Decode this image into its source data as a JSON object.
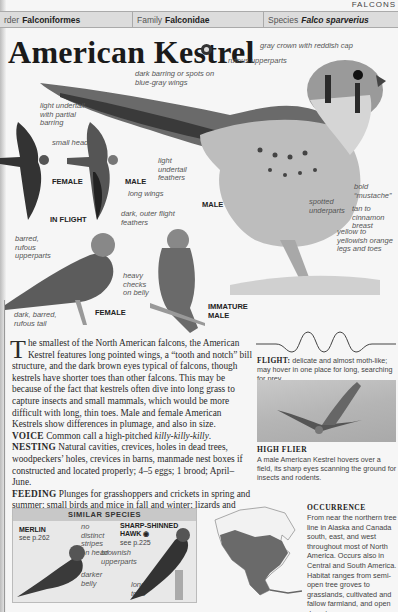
{
  "section_tag": "FALCONS",
  "taxonomy": {
    "order_label": "Order",
    "order_label_visible": "rder",
    "order_value": "Falconiformes",
    "family_label": "Family",
    "family_value": "Falconidae",
    "species_label": "Species",
    "species_value": "Falco sparverius"
  },
  "title": "American Kestrel",
  "audio_icon": "audio-disc-icon",
  "main_illustration": {
    "caption": "MALE",
    "labels": [
      "gray crown with reddish cap",
      "rufous upperparts",
      "dark barring or spots on blue-gray wings",
      "light undertail with partial barring",
      "light undertail feathers",
      "bold “mustache”",
      "tan to cinnamon breast",
      "spotted underparts",
      "yellow to yellowish orange legs and toes"
    ]
  },
  "in_flight": {
    "caption": "IN FLIGHT",
    "female": "FEMALE",
    "male": "MALE",
    "labels": [
      "small head",
      "long wings",
      "dark, outer flight feathers"
    ]
  },
  "perched": {
    "female_caption": "FEMALE",
    "immature_caption": "IMMATURE MALE",
    "labels": [
      "barred, rufous upperparts",
      "dark, barred, rufous tail",
      "heavy checks on belly"
    ]
  },
  "body": {
    "dropcap": "T",
    "intro": "he smallest of the North American falcons, the American Kestrel features long pointed wings, a “tooth and notch” bill structure, and the dark brown eyes typical of falcons, though kestrels have shorter toes than other falcons. This may be because of the fact that kestrels often dive into long grass to capture insects and small mammals, which would be more difficult with long, thin toes. Male and female American Kestrels show differences in plumage, and also in size.",
    "voice_label": "VOICE",
    "voice_text_pre": "Common call a high-pitched ",
    "voice_call": "killy-killy-killy",
    "voice_text_post": ".",
    "nesting_label": "NESTING",
    "nesting_text": "Natural cavities, crevices, holes in dead trees, woodpeckers’ holes, crevices in barns, manmade nest boxes if constructed and located properly; 4–5 eggs; 1 brood; April–June.",
    "feeding_label": "FEEDING",
    "feeding_text": "Plunges for grasshoppers and crickets in spring and summer; small birds and mice in fall and winter; lizards and snakes."
  },
  "flight": {
    "label": "FLIGHT:",
    "text": "delicate and almost moth-like; may hover in one place for long, searching for prey."
  },
  "photo": {
    "title": "HIGH FLIER",
    "caption": "A male American Kestrel hovers over a field, its sharp eyes scanning the ground for insects and rodents."
  },
  "similar_species": {
    "heading": "SIMILAR SPECIES",
    "species": [
      {
        "name": "MERLIN",
        "ref": "see p.262",
        "labels": [
          "no distinct stripes on head",
          "darker belly"
        ]
      },
      {
        "name": "SHARP-SHINNED HAWK",
        "icon": "audio-disc-icon",
        "ref": "see p.225",
        "labels": [
          "brownish upperparts",
          "longer toes"
        ]
      }
    ]
  },
  "occurrence": {
    "title": "OCCURRENCE",
    "text": "From near the northern tree line in Alaska and Canada south, east, and west throughout most of North America. Occurs also in Central and South America. Habitat ranges from semi-open tree groves to grasslands, cultivated and fallow farmland, and open desert."
  }
}
